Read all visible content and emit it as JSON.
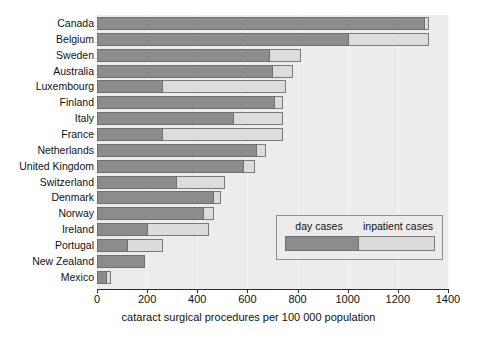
{
  "chart_data": {
    "type": "bar",
    "orientation": "horizontal",
    "stacked": true,
    "title": "",
    "xlabel": "cataract surgical procedures per 100 000 population",
    "ylabel": "",
    "xlim": [
      0,
      1400
    ],
    "xticks": [
      0,
      200,
      400,
      600,
      800,
      1000,
      1200,
      1400
    ],
    "xtick_labels": [
      "0",
      "200",
      "400",
      "600",
      "800",
      "1000",
      "1200",
      "1400"
    ],
    "grid": true,
    "legend_position": "inside-lower-right",
    "categories": [
      "Canada",
      "Belgium",
      "Sweden",
      "Australia",
      "Luxembourg",
      "Finland",
      "Italy",
      "France",
      "Netherlands",
      "United Kingdom",
      "Switzerland",
      "Denmark",
      "Norway",
      "Ireland",
      "Portugal",
      "New Zealand",
      "Mexico"
    ],
    "series": [
      {
        "name": "day cases",
        "color": "#8c8c8c",
        "values": [
          1310,
          1005,
          690,
          700,
          265,
          710,
          545,
          265,
          640,
          585,
          320,
          465,
          425,
          205,
          125,
          190,
          40
        ]
      },
      {
        "name": "inpatient cases",
        "color": "#dcdcdc",
        "values": [
          15,
          320,
          125,
          80,
          490,
          30,
          195,
          475,
          35,
          45,
          190,
          30,
          40,
          240,
          140,
          0,
          17
        ]
      }
    ],
    "totals": [
      1325,
      1325,
      815,
      780,
      755,
      740,
      740,
      740,
      675,
      630,
      510,
      495,
      465,
      445,
      265,
      190,
      57
    ]
  },
  "legend": {
    "day_label": "day cases",
    "inpatient_label": "inpatient cases"
  },
  "colors": {
    "day_cases": "#8c8c8c",
    "inpatient_cases": "#dcdcdc",
    "plot_background": "#ececec",
    "page_background": "#ffffff",
    "axis": "#2b2b2b"
  }
}
